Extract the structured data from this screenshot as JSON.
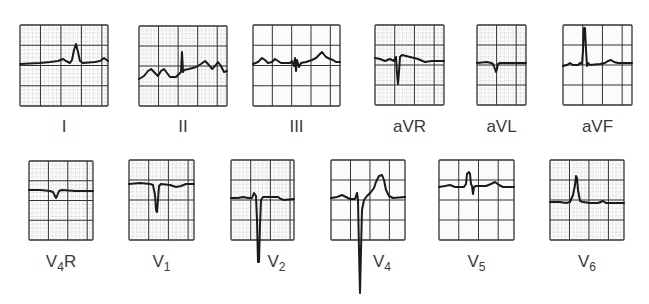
{
  "figure": {
    "type": "12-lead ECG complexes",
    "colors": {
      "trace": "#1a1a1a",
      "grid_major": "#333333",
      "grid_minor": "#9a9a9a",
      "label": "#3a3a3a"
    },
    "rows": [
      {
        "leads": [
          {
            "id": "I",
            "label": "I",
            "sub": "",
            "box": [
              20,
              25,
              88,
              81
            ],
            "cols": 4.3,
            "rows": 4,
            "dotted": true,
            "dense": true,
            "baseline": 63,
            "trace": "M20,64 L40,63 L50,62 L58,61 L63,59 L66,61 L70,63 L72,60 L74,50 L76,44 L78,52 L80,61 L83,63 L95,62 L100,61 L104,58 L108,61"
          },
          {
            "id": "II",
            "label": "II",
            "sub": "",
            "box": [
              139,
              26,
              88,
              80
            ],
            "cols": 4.5,
            "rows": 4,
            "dotted": true,
            "dense": false,
            "baseline": 73,
            "trace": "M139,79 L144,76 L148,71 L151,69 L155,73 L158,76 L161,71 L164,69 L167,73 L170,77 L176,77 L179,74 L181,72 L182,52 L183,72 L184,70 L189,69 L196,67 L201,64 L205,61 L209,65 L212,69 L215,66 L218,62 L221,66 L224,72 L227,71"
          },
          {
            "id": "III",
            "label": "III",
            "sub": "",
            "box": [
              253,
              25,
              87,
              81
            ],
            "cols": 4.5,
            "rows": 4,
            "dotted": false,
            "dense": false,
            "baseline": 64,
            "trace": "M253,64 L258,62 L262,58 L265,60 L268,63 L272,62 L275,59 L278,61 L281,63 L290,63 L292,61 L294,66 L295,58 L296,71 L297,60 L299,67 L301,63 L306,62 L312,60 L316,58 L319,55 L322,52 L326,57 L330,59 L333,60 L336,62 L340,62"
          },
          {
            "id": "aVR",
            "label": "aVR",
            "sub": "",
            "box": [
              375,
              25,
              69,
              80
            ],
            "cols": 3.5,
            "rows": 4,
            "dotted": true,
            "dense": false,
            "baseline": 60,
            "trace": "M375,58 L380,59 L385,61 L390,59 L394,61 L396,57 L397,74 L398,84 L399,72 L400,57 L402,55 L410,57 L418,59 L425,62 L432,61 L444,61"
          },
          {
            "id": "aVL",
            "label": "aVL",
            "sub": "",
            "box": [
              477,
              25,
              49,
              80
            ],
            "cols": 2.5,
            "rows": 4,
            "dotted": true,
            "dense": false,
            "baseline": 63,
            "trace": "M477,63 L487,62 L491,63 L493,64 L495,69 L496,72 L497,69 L498,64 L500,63 L510,63 L526,63"
          },
          {
            "id": "aVF",
            "label": "aVF",
            "sub": "",
            "box": [
              563,
              25,
              69,
              80
            ],
            "cols": 3.5,
            "rows": 4,
            "dotted": false,
            "dense": false,
            "baseline": 65,
            "trace": "M563,66 L567,65 L570,63 L573,65 L578,65 L580,63 L582,64 L583,51 L584,28 L585,28 L586,50 L587,66 L588,63 L590,65 L600,64 L605,63 L608,61 L611,60 L614,62 L618,63 L632,63"
          }
        ],
        "label_y": 118
      },
      {
        "leads": [
          {
            "id": "V4R",
            "label": "V",
            "sub": "4",
            "suffix": "R",
            "box": [
              29,
              161,
              64,
              79
            ],
            "cols": 3.3,
            "rows": 4,
            "dotted": true,
            "dense": false,
            "baseline": 190,
            "trace": "M29,190 L40,190 L50,191 L53,192 L55,196 L56,198 L57,196 L59,191 L62,190 L75,191 L93,191"
          },
          {
            "id": "V1",
            "label": "V",
            "sub": "1",
            "suffix": "",
            "box": [
              129,
              160,
              65,
              80
            ],
            "cols": 3.3,
            "rows": 4,
            "dotted": true,
            "dense": false,
            "baseline": 183,
            "trace": "M129,184 L140,183 L150,184 L153,185 L155,195 L156,210 L157,212 L158,200 L159,186 L161,184 L170,185 L176,187 L181,186 L186,184 L194,184"
          },
          {
            "id": "V2",
            "label": "V",
            "sub": "2",
            "suffix": "",
            "box": [
              231,
              160,
              63,
              80
            ],
            "cols": 3.2,
            "rows": 4,
            "dotted": true,
            "dense": false,
            "baseline": 198,
            "trace": "M231,198 L238,198 L243,197 L248,198 L252,198 L254,193 L256,196 L257,220 L258,262 L259,262 L260,225 L261,200 L263,197 L270,197 L278,197 L281,199 L284,200 L294,199"
          },
          {
            "id": "V4",
            "label": "V",
            "sub": "4",
            "suffix": "",
            "box": [
              331,
              160,
              74,
              80
            ],
            "cols": 3.8,
            "rows": 4,
            "dotted": false,
            "dense": false,
            "baseline": 196,
            "trace": "M331,198 L337,197 L342,195 L346,197 L350,199 L355,199 L357,193 L358,200 L359,250 L360,293 L361,250 L362,210 L364,200 L367,196 L371,192 L374,188 L376,182 L379,176 L382,175 L384,180 L386,190 L389,196 L393,198 L405,197"
          },
          {
            "id": "V5",
            "label": "V",
            "sub": "5",
            "suffix": "",
            "box": [
              439,
              160,
              75,
              80
            ],
            "cols": 3.8,
            "rows": 4,
            "dotted": false,
            "dense": false,
            "baseline": 188,
            "trace": "M439,187 L445,186 L450,185 L455,187 L464,187 L466,184 L467,174 L469,172 L470,174 L471,184 L472,186 L473,194 L474,187 L476,186 L486,186 L491,184 L495,182 L499,185 L503,187 L514,187"
          },
          {
            "id": "V6",
            "label": "V",
            "sub": "6",
            "suffix": "",
            "box": [
              550,
              160,
              74,
              80
            ],
            "cols": 3.8,
            "rows": 4,
            "dotted": true,
            "dense": false,
            "baseline": 202,
            "trace": "M550,202 L560,202 L566,203 L570,202 L573,195 L575,185 L576,176 L577,178 L578,190 L580,201 L583,202 L590,203 L598,203 L603,201 L606,203 L612,203 L624,203"
          }
        ],
        "label_y": 253
      }
    ],
    "labels_top": [
      "I",
      "II",
      "III",
      "aVR",
      "aVL",
      "aVF"
    ],
    "labels_bottom": [
      "V4R",
      "V1",
      "V2",
      "V4",
      "V5",
      "V6"
    ]
  }
}
